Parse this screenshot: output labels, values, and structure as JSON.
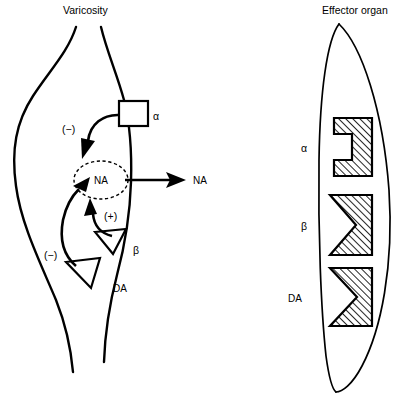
{
  "figure": {
    "type": "biological-schematic",
    "background_color": "#ffffff",
    "line_color": "#000000"
  },
  "titles": {
    "left": "Varicosity",
    "right": "Effector organ"
  },
  "varicosity": {
    "transmitter_label": "NA",
    "released_transmitter_label": "NA",
    "autoreceptors": [
      {
        "id": "alpha",
        "label": "α",
        "glyph": "square",
        "sign": "(−)",
        "sign_name": "minus"
      },
      {
        "id": "beta",
        "label": "β",
        "glyph": "triangle",
        "sign": "(+)",
        "sign_name": "plus"
      },
      {
        "id": "da",
        "label": "DA",
        "glyph": "triangle",
        "sign": "(−)",
        "sign_name": "minus"
      }
    ]
  },
  "effector_organ": {
    "receptors": [
      {
        "id": "alpha",
        "label": "α",
        "notch": "rectangular"
      },
      {
        "id": "beta",
        "label": "β",
        "notch": "triangular"
      },
      {
        "id": "da",
        "label": "DA",
        "notch": "triangular"
      }
    ]
  },
  "colors": {
    "ink": "#000000",
    "paper": "#ffffff",
    "hatch": "#000000"
  }
}
